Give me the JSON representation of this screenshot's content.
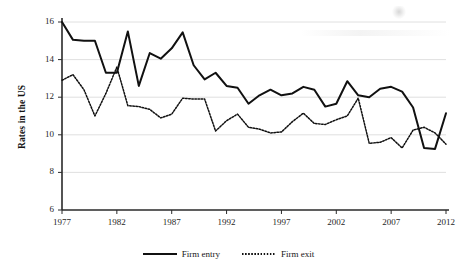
{
  "chart": {
    "ylabel": "Rates in the US",
    "xlabel": "",
    "title": ""
  },
  "axes": {
    "yticks": [
      "6",
      "8",
      "10",
      "12",
      "14",
      "16"
    ],
    "xticks": [
      "1977",
      "1982",
      "1987",
      "1992",
      "1997",
      "2002",
      "2007",
      "2012"
    ]
  },
  "legend": {
    "entry_label": "Firm entry",
    "exit_label": "Firm exit"
  },
  "chart_data": {
    "type": "line",
    "title": "",
    "xlabel": "",
    "ylabel": "Rates in the US",
    "xlim": [
      1977,
      2012
    ],
    "ylim": [
      6,
      16
    ],
    "yticks": [
      6,
      8,
      10,
      12,
      14,
      16
    ],
    "xticks": [
      1977,
      1982,
      1987,
      1992,
      1997,
      2002,
      2007,
      2012
    ],
    "grid": "horizontal",
    "legend_position": "bottom-center",
    "x": [
      1977,
      1978,
      1979,
      1980,
      1981,
      1982,
      1983,
      1984,
      1985,
      1986,
      1987,
      1988,
      1989,
      1990,
      1991,
      1992,
      1993,
      1994,
      1995,
      1996,
      1997,
      1998,
      1999,
      2000,
      2001,
      2002,
      2003,
      2004,
      2005,
      2006,
      2007,
      2008,
      2009,
      2010,
      2011,
      2012
    ],
    "series": [
      {
        "name": "Firm entry",
        "style": "solid",
        "color": "#111111",
        "values": [
          16.0,
          15.05,
          15.0,
          15.0,
          13.3,
          13.3,
          15.5,
          12.6,
          14.35,
          14.05,
          14.6,
          15.45,
          13.7,
          12.95,
          13.3,
          12.6,
          12.5,
          11.65,
          12.1,
          12.4,
          12.1,
          12.2,
          12.55,
          12.4,
          11.5,
          11.65,
          12.85,
          12.1,
          12.0,
          12.45,
          12.55,
          12.3,
          11.45,
          9.3,
          9.25,
          11.15
        ]
      },
      {
        "name": "Firm exit",
        "style": "dotted",
        "color": "#111111",
        "values": [
          12.9,
          13.2,
          12.4,
          11.0,
          12.2,
          13.6,
          11.55,
          11.5,
          11.35,
          10.9,
          11.1,
          11.95,
          11.9,
          11.9,
          10.2,
          10.75,
          11.1,
          10.4,
          10.3,
          10.1,
          10.15,
          10.7,
          11.15,
          10.6,
          10.55,
          10.8,
          11.0,
          11.95,
          9.55,
          9.6,
          9.85,
          9.3,
          10.25,
          10.4,
          10.1,
          9.5
        ]
      }
    ]
  }
}
